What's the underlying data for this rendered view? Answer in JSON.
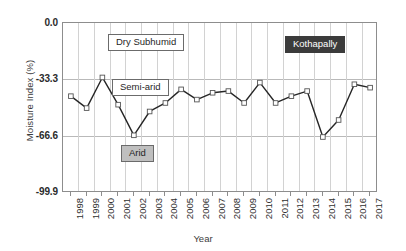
{
  "chart_data": {
    "type": "line",
    "title": "",
    "site_label": "Kothapally",
    "xlabel": "Year",
    "ylabel": "Moisture Index (%)",
    "categories": [
      "1998",
      "1999",
      "2000",
      "2001",
      "2002",
      "2003",
      "2004",
      "2005",
      "2006",
      "2007",
      "2008",
      "2009",
      "2010",
      "2011",
      "2012",
      "2013",
      "2014",
      "2015",
      "2016",
      "2017"
    ],
    "values": [
      -43.0,
      -50.0,
      -32.0,
      -48.0,
      -66.0,
      -52.0,
      -47.0,
      -39.0,
      -45.0,
      -41.0,
      -40.0,
      -47.0,
      -35.0,
      -47.0,
      -43.0,
      -40.0,
      -67.0,
      -57.0,
      -36.0,
      -38.0
    ],
    "series": [
      {
        "name": "Kothapally",
        "values": [
          -43.0,
          -50.0,
          -32.0,
          -48.0,
          -66.0,
          -52.0,
          -47.0,
          -39.0,
          -45.0,
          -41.0,
          -40.0,
          -47.0,
          -35.0,
          -47.0,
          -43.0,
          -40.0,
          -67.0,
          -57.0,
          -36.0,
          -38.0
        ],
        "line_color": "#262626",
        "marker": "open-square"
      }
    ],
    "ylim": [
      -99.9,
      0.0
    ],
    "yticks": [
      0.0,
      -33.3,
      -66.6,
      -99.9
    ],
    "ytick_labels": [
      "0.0",
      "-33.3",
      "-66.6",
      "-99.9"
    ],
    "grid": "both",
    "legend_position": "none",
    "annotations": [
      {
        "id": "dry-subhumid",
        "text": "Dry Subhumid",
        "style": "light"
      },
      {
        "id": "semi-arid",
        "text": "Semi-arid",
        "style": "light"
      },
      {
        "id": "arid",
        "text": "Arid",
        "style": "gray"
      },
      {
        "id": "site",
        "text": "Kothapally",
        "style": "dark"
      }
    ],
    "colors": {
      "line": "#262626",
      "marker_fill": "#ffffff",
      "grid": "#d2d2d2",
      "axis": "#8d8d8d",
      "annotation_dark_bg": "#3b3b3b",
      "annotation_gray_bg": "#bfbfbf",
      "background": "#ffffff"
    }
  }
}
